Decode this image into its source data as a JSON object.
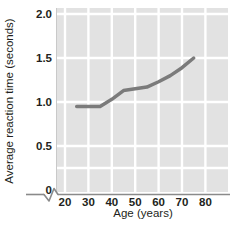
{
  "chart_data": {
    "type": "line",
    "title": "",
    "xlabel": "Age (years)",
    "ylabel": "Average reaction time (seconds)",
    "xlim": [
      20,
      85
    ],
    "ylim": [
      0,
      2.1
    ],
    "xticks": [
      "20",
      "30",
      "40",
      "50",
      "60",
      "70",
      "80"
    ],
    "xtick_values": [
      20,
      30,
      40,
      50,
      60,
      70,
      80
    ],
    "yticks": [
      "0",
      "0.5",
      "1.0",
      "1.5",
      "2.0"
    ],
    "ytick_values": [
      0,
      0.5,
      1.0,
      1.5,
      2.0
    ],
    "grid": true,
    "grid_color": "#ffffff",
    "plot_background": "#e2e2e2",
    "legend": false,
    "axis_break": {
      "axis": "x",
      "symbol": "zigzag",
      "between": [
        "0",
        "20"
      ]
    },
    "series": [
      {
        "name": "Average reaction time",
        "color": "#7b7b7b",
        "line_width": 3.5,
        "x": [
          25,
          30,
          35,
          40,
          45,
          50,
          55,
          60,
          65,
          70,
          75
        ],
        "values": [
          0.95,
          0.95,
          0.95,
          1.03,
          1.13,
          1.15,
          1.17,
          1.23,
          1.3,
          1.39,
          1.5
        ]
      }
    ]
  },
  "axis": {
    "x_axis_line_color": "#808080",
    "y_axis_line_color": "#bfbfbf"
  }
}
